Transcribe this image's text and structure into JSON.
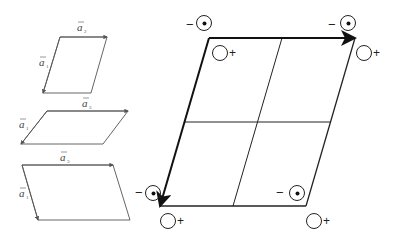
{
  "figure": {
    "small_cells": [
      {
        "id": "cell-1",
        "top_label": "a",
        "top_sub": "2",
        "left_label": "a",
        "left_sub": "1",
        "points": "60,37 107,37 91,93 43,93"
      },
      {
        "id": "cell-2",
        "top_label": "a",
        "top_sub": "3",
        "left_label": "a",
        "left_sub": "1",
        "points": "47,111 128,111 103,144 21,144"
      },
      {
        "id": "cell-3",
        "top_label": "a",
        "top_sub": "3",
        "left_label": "a",
        "left_sub": "1",
        "points": "22,165 113,165 130,220 38,220"
      }
    ],
    "large_cell": {
      "divisions": "2x2",
      "corner_markers": [
        {
          "position": "top-left",
          "minus": "−",
          "plus": "+"
        },
        {
          "position": "top-right",
          "minus": "−",
          "plus": "+"
        },
        {
          "position": "bottom-left",
          "minus": "−",
          "plus": "+"
        },
        {
          "position": "bottom-right",
          "minus": "−",
          "plus": "+"
        }
      ]
    },
    "colors": {
      "line": "#222222",
      "thin_line": "#555555",
      "background": "#ffffff"
    }
  }
}
